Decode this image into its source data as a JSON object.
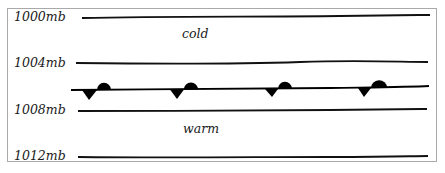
{
  "diagram": {
    "isobars": [
      {
        "label": "1000mb",
        "label_x": 14,
        "label_y": 11,
        "y": 18
      },
      {
        "label": "1004mb",
        "label_x": 14,
        "label_y": 57,
        "y": 64
      },
      {
        "label": "1008mb",
        "label_x": 14,
        "label_y": 104,
        "y": 111
      },
      {
        "label": "1012mb",
        "label_x": 14,
        "label_y": 149,
        "y": 157
      }
    ],
    "regions": {
      "cold": "cold",
      "warm": "warm"
    },
    "front": {
      "type": "stationary-front",
      "y": 90,
      "color": "#000000",
      "symbol_positions_x": [
        95,
        183,
        277,
        372
      ]
    },
    "colors": {
      "border": "#a9a9a9",
      "line": "#111111",
      "text": "#1a1a1a"
    }
  }
}
